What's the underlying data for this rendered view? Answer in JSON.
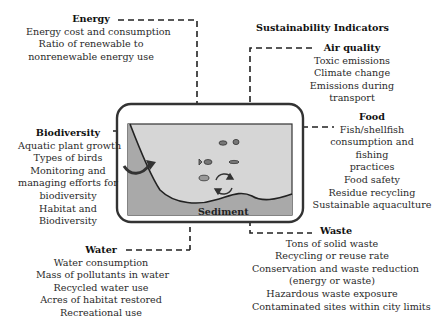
{
  "heading": "Sustainability Indicators",
  "illustration": {
    "label": "Sediment",
    "colors": {
      "water": "#d6d6d6",
      "bank": "#a9a9a9",
      "sediment": "#9e9e9e",
      "outline": "#333333"
    }
  },
  "indicators": {
    "energy": {
      "title": "Energy",
      "items": [
        "Energy cost and consumption",
        "Ratio of renewable to",
        "nonrenewable energy use"
      ]
    },
    "air_quality": {
      "title": "Air quality",
      "items": [
        "Toxic emissions",
        "Climate change",
        "Emissions during",
        "transport"
      ]
    },
    "biodiversity": {
      "title": "Biodiversity",
      "items": [
        "Aquatic plant growth",
        "Types of birds",
        "Monitoring and",
        "managing efforts for",
        "biodiversity",
        "Habitat and",
        "Biodiversity"
      ]
    },
    "food": {
      "title": "Food",
      "items": [
        "Fish/shellfish",
        "consumption and",
        "fishing",
        "practices",
        "Food safety",
        "Residue recycling",
        "Sustainable aquaculture"
      ]
    },
    "water": {
      "title": "Water",
      "items": [
        "Water consumption",
        "Mass of pollutants in water",
        "Recycled water use",
        "Acres of habitat restored",
        "Recreational use"
      ]
    },
    "waste": {
      "title": "Waste",
      "items": [
        "Tons of solid waste",
        "Recycling or reuse rate",
        "Conservation and waste reduction",
        "(energy or waste)",
        "Hazardous waste exposure",
        "Contaminated sites within city limits"
      ]
    }
  }
}
